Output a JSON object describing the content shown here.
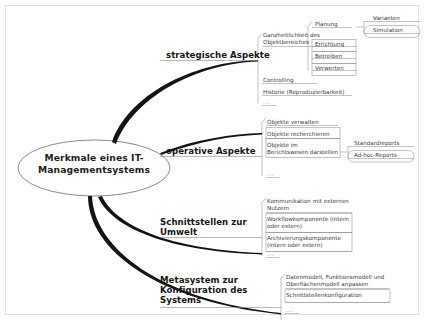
{
  "diagram": {
    "type": "mind-map",
    "language": "de",
    "root": {
      "label": "Merkmale eines IT-Managementsystems"
    },
    "ellipsis": "...",
    "colors": {
      "ink": "#2b2b2b",
      "branch_line": "#1a1a1a",
      "leaf_line": "#9a9a9a",
      "frame": "#e2e2e2",
      "background": "#ffffff"
    },
    "branches": [
      {
        "label": "strategische Aspekte",
        "children": [
          {
            "label": "Ganzheitlichkeit des Objektbereiches",
            "children": [
              {
                "label": "Planung",
                "children": [
                  {
                    "label": "Varianten",
                    "boxed": false
                  },
                  {
                    "label": "Simulation",
                    "boxed": true
                  }
                ]
              },
              {
                "label": "Errichtung"
              },
              {
                "label": "Betreiben"
              },
              {
                "label": "Verwerten"
              }
            ]
          },
          {
            "label": "Controlling"
          },
          {
            "label": "Historie (Reproduzierbarkeit)"
          },
          {
            "label": "..."
          }
        ]
      },
      {
        "label": "operative Aspekte",
        "children": [
          {
            "label": "Objekte verwalten"
          },
          {
            "label": "Objekte recherchieren"
          },
          {
            "label": "Objekte im Berichtswesen darstellen",
            "children": [
              {
                "label": "Standardreports",
                "boxed": false
              },
              {
                "label": "Ad-hoc-Reports",
                "boxed": true
              }
            ]
          },
          {
            "label": "..."
          }
        ]
      },
      {
        "label": "Schnittstellen zur Umwelt",
        "children": [
          {
            "label": "Kommunikation mit externen Nutzern"
          },
          {
            "label": "Workflowkomponente (intern oder extern)"
          },
          {
            "label": "Archivierungskomponente (intern oder extern)"
          },
          {
            "label": "..."
          }
        ]
      },
      {
        "label": "Metasystem zur Konfiguration des Systems",
        "children": [
          {
            "label": "Datenmodell, Funktionsmodell und Oberflächenmodell anpassen"
          },
          {
            "label": "Schnittstellenkonfiguration"
          },
          {
            "label": "..."
          }
        ]
      }
    ]
  }
}
